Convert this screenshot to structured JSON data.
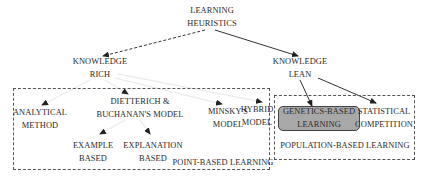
{
  "diagram": {
    "root": {
      "line1": "LEARNING",
      "line2": "HEURISTICS"
    },
    "knowledge_rich": {
      "line1": "KNOWLEDGE",
      "line2": "RICH"
    },
    "knowledge_lean": {
      "line1": "KNOWLEDGE",
      "line2": "LEAN"
    },
    "point_based_group": {
      "label": "POINT-BASED LEARNING",
      "nodes": {
        "analytical": {
          "line1": "ANALYTICAL",
          "line2": "METHOD"
        },
        "dietterich": {
          "line1": "DIETTERICH &",
          "line2": "BUCHANAN'S MODEL"
        },
        "minsky": {
          "line1": "MINSKY'S",
          "line2": "MODEL"
        },
        "hybrid": {
          "line1": "HYBRID",
          "line2": "MODEL"
        },
        "example": {
          "line1": "EXAMPLE",
          "line2": "BASED"
        },
        "explanation": {
          "line1": "EXPLANATION",
          "line2": "BASED"
        }
      }
    },
    "population_based_group": {
      "label": "POPULATION-BASED LEARNING",
      "nodes": {
        "genetics": {
          "line1": "GENETICS-BASED",
          "line2": "LEARNING",
          "highlighted": true
        },
        "statistical": {
          "line1": "STATISTICAL",
          "line2": "COMPETITION"
        }
      }
    },
    "edges": [
      {
        "from": "root",
        "to": "knowledge_rich",
        "style": "dashed"
      },
      {
        "from": "root",
        "to": "knowledge_lean",
        "style": "solid"
      },
      {
        "from": "knowledge_rich",
        "to": "analytical",
        "style": "faint"
      },
      {
        "from": "knowledge_rich",
        "to": "dietterich",
        "style": "faint"
      },
      {
        "from": "knowledge_rich",
        "to": "minsky",
        "style": "faint"
      },
      {
        "from": "knowledge_rich",
        "to": "hybrid",
        "style": "faint"
      },
      {
        "from": "dietterich",
        "to": "example",
        "style": "faint"
      },
      {
        "from": "dietterich",
        "to": "explanation",
        "style": "faint"
      },
      {
        "from": "knowledge_lean",
        "to": "genetics",
        "style": "solid"
      },
      {
        "from": "knowledge_lean",
        "to": "statistical",
        "style": "solid"
      }
    ],
    "colors": {
      "highlight_fill": "#a8a8a8",
      "line": "#333333",
      "faint_line": "#e6e6e6"
    }
  }
}
